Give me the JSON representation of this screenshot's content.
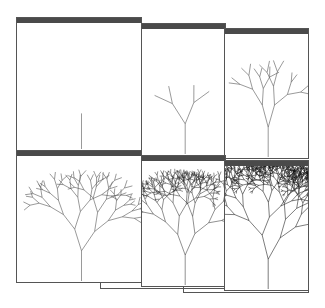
{
  "scene": {
    "description": "Six overlapping program windows showing successive iterations of a recursive fractal tree",
    "background": "#ffffff",
    "frame_color": "#555555",
    "titlebar_color": "#4a4a4a"
  },
  "windows": [
    {
      "id": 1,
      "iteration": 1,
      "label": "Stem",
      "x": 16,
      "y": 17,
      "w": 126,
      "h": 134,
      "depth": 0
    },
    {
      "id": 2,
      "iteration": 2,
      "label": "Y-branch",
      "x": 141,
      "y": 23,
      "w": 85,
      "h": 133,
      "depth": 2
    },
    {
      "id": 3,
      "iteration": 3,
      "label": "Branching",
      "x": 224,
      "y": 28,
      "w": 85,
      "h": 131,
      "depth": 4
    },
    {
      "id": 4,
      "iteration": 4,
      "label": "Sparse crown",
      "x": 16,
      "y": 150,
      "w": 126,
      "h": 133,
      "depth": 6
    },
    {
      "id": 5,
      "iteration": 5,
      "label": "Dense crown",
      "x": 141,
      "y": 155,
      "w": 85,
      "h": 132,
      "depth": 8
    },
    {
      "id": 6,
      "iteration": 6,
      "label": "Full crown",
      "x": 224,
      "y": 160,
      "w": 85,
      "h": 131,
      "depth": 10
    }
  ],
  "extra_edges": [
    {
      "x": 100,
      "y": 270,
      "w": 126,
      "h": 19
    },
    {
      "x": 183,
      "y": 275,
      "w": 126,
      "h": 18
    }
  ]
}
